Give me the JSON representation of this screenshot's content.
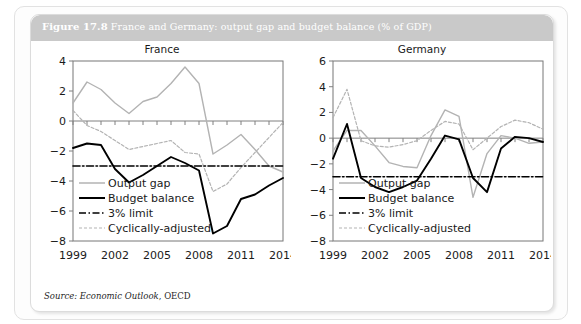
{
  "figure": {
    "number": "Figure 17.8",
    "title": "France and Germany: output gap and budget balance (% of GDP)",
    "source_label": "Source:",
    "source_publication": "Economic Outlook",
    "source_organisation": ", OECD"
  },
  "legend": {
    "output_gap": "Output gap",
    "budget_balance": "Budget balance",
    "limit": "3% limit",
    "cyclically_adjusted": "Cyclically-adjusted"
  },
  "colors": {
    "output_gap": "#b3b3b3",
    "budget_balance": "#000000",
    "limit": "#000000",
    "cyclically_adjusted": "#b3b3b3",
    "axis": "#808080",
    "frame": "#777777",
    "header_bar": "#c9c9c9",
    "header_text": "#ffffff"
  },
  "chart_data": [
    {
      "type": "line",
      "title": "France",
      "xlabel": "",
      "ylabel": "",
      "xlim": [
        1999,
        2014
      ],
      "ylim": [
        -8,
        4
      ],
      "yticks": [
        -8,
        -6,
        -4,
        -2,
        0,
        2,
        4
      ],
      "xticks": [
        1999,
        2002,
        2005,
        2008,
        2011,
        2014
      ],
      "xticklabels": [
        "1999",
        "2002",
        "2005",
        "2008",
        "2011",
        "2014"
      ],
      "yticklabels": [
        "-8",
        "-6",
        "-4",
        "-2",
        "0",
        "2",
        "4"
      ],
      "grid": false,
      "legend_position": "lower left",
      "x": [
        1999,
        2000,
        2001,
        2002,
        2003,
        2004,
        2005,
        2006,
        2007,
        2008,
        2009,
        2010,
        2011,
        2012,
        2013,
        2014
      ],
      "series": [
        {
          "name": "Output gap",
          "style": "solid-grey",
          "values": [
            1.2,
            2.6,
            2.1,
            1.2,
            0.5,
            1.3,
            1.6,
            2.5,
            3.6,
            2.5,
            -2.2,
            -1.6,
            -0.9,
            -1.9,
            -3.0,
            -3.4
          ]
        },
        {
          "name": "Budget balance",
          "style": "solid-black",
          "values": [
            -1.8,
            -1.5,
            -1.6,
            -3.2,
            -4.1,
            -3.6,
            -3.0,
            -2.4,
            -2.8,
            -3.3,
            -7.5,
            -7.0,
            -5.2,
            -4.9,
            -4.3,
            -3.8
          ]
        },
        {
          "name": "Cyclically-adjusted",
          "style": "dotted-grey",
          "values": [
            0.7,
            -0.3,
            -0.7,
            -1.3,
            -1.9,
            -1.7,
            -1.5,
            -1.3,
            -2.1,
            -2.2,
            -4.7,
            -4.2,
            -3.1,
            -2.1,
            -1.1,
            -0.1
          ]
        },
        {
          "name": "3% limit",
          "style": "dashdot-black",
          "values": [
            -3.0,
            -3.0,
            -3.0,
            -3.0,
            -3.0,
            -3.0,
            -3.0,
            -3.0,
            -3.0,
            -3.0,
            -3.0,
            -3.0,
            -3.0,
            -3.0,
            -3.0,
            -3.0
          ]
        }
      ]
    },
    {
      "type": "line",
      "title": "Germany",
      "xlabel": "",
      "ylabel": "",
      "xlim": [
        1999,
        2014
      ],
      "ylim": [
        -8,
        6
      ],
      "yticks": [
        -8,
        -6,
        -4,
        -2,
        0,
        2,
        4,
        6
      ],
      "xticks": [
        1999,
        2002,
        2005,
        2008,
        2011,
        2014
      ],
      "xticklabels": [
        "1999",
        "2002",
        "2005",
        "2008",
        "2011",
        "2014"
      ],
      "yticklabels": [
        "-8",
        "-6",
        "-4",
        "-2",
        "0",
        "2",
        "4",
        "6"
      ],
      "grid": false,
      "legend_position": "lower left",
      "x": [
        1999,
        2000,
        2001,
        2002,
        2003,
        2004,
        2005,
        2006,
        2007,
        2008,
        2009,
        2010,
        2011,
        2012,
        2013,
        2014
      ],
      "series": [
        {
          "name": "Output gap",
          "style": "solid-grey",
          "values": [
            -1.0,
            0.6,
            0.6,
            -0.6,
            -1.9,
            -2.2,
            -2.3,
            0.2,
            2.2,
            1.7,
            -4.6,
            -1.2,
            0.2,
            0.0,
            -0.4,
            -0.3
          ]
        },
        {
          "name": "Budget balance",
          "style": "solid-black",
          "values": [
            -1.6,
            1.1,
            -3.1,
            -3.8,
            -4.2,
            -3.8,
            -3.3,
            -1.6,
            0.2,
            -0.1,
            -3.1,
            -4.2,
            -0.8,
            0.1,
            0.0,
            -0.3
          ]
        },
        {
          "name": "Cyclically-adjusted",
          "style": "dotted-grey",
          "values": [
            1.6,
            3.8,
            -0.2,
            -0.6,
            -0.7,
            -0.5,
            -0.2,
            0.6,
            1.3,
            1.1,
            -0.9,
            0.0,
            0.9,
            1.4,
            1.2,
            0.7
          ]
        },
        {
          "name": "3% limit",
          "style": "dashdot-black",
          "values": [
            -3.0,
            -3.0,
            -3.0,
            -3.0,
            -3.0,
            -3.0,
            -3.0,
            -3.0,
            -3.0,
            -3.0,
            -3.0,
            -3.0,
            -3.0,
            -3.0,
            -3.0,
            -3.0
          ]
        }
      ]
    }
  ]
}
